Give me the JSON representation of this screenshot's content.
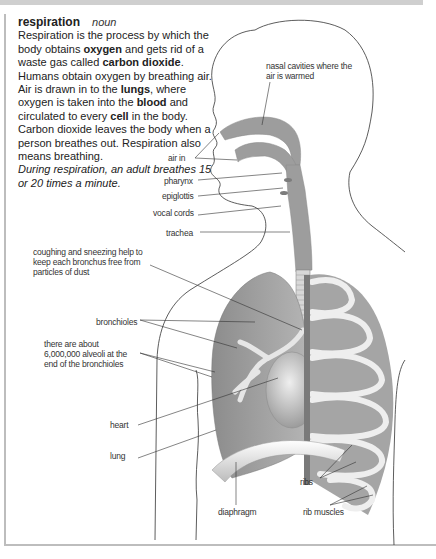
{
  "entry": {
    "headword": "respiration",
    "part_of_speech": "noun",
    "definition_parts": [
      {
        "text": "Respiration is the process by which the body obtains ",
        "bold": false
      },
      {
        "text": "oxygen",
        "bold": true
      },
      {
        "text": " and gets rid of a waste gas called ",
        "bold": false
      },
      {
        "text": "carbon dioxide",
        "bold": true
      },
      {
        "text": ". Humans obtain oxygen by breathing air. Air is drawn in to the ",
        "bold": false
      },
      {
        "text": "lungs",
        "bold": true
      },
      {
        "text": ", where oxygen is taken into the ",
        "bold": false
      },
      {
        "text": "blood",
        "bold": true
      },
      {
        "text": " and circulated to every ",
        "bold": false
      },
      {
        "text": "cell",
        "bold": true
      },
      {
        "text": " in the body. Carbon dioxide leaves the body when a person breathes out. Respiration also means breathing.",
        "bold": false
      }
    ],
    "example": "During respiration, an adult breathes 15 or 20 times a minute."
  },
  "labels": {
    "nasal_cavities": "nasal cavities where the air is warmed",
    "air_in": "air in",
    "pharynx": "pharynx",
    "epiglottis": "epiglottis",
    "vocal_cords": "vocal cords",
    "trachea": "trachea",
    "coughing": "coughing and sneezing help to keep each bronchus free from particles of dust",
    "bronchioles": "bronchioles",
    "alveoli": "there are about 6,000,000 alveoli at the end of the bronchioles",
    "heart": "heart",
    "lung": "lung",
    "ribs": "ribs",
    "diaphragm": "diaphragm",
    "rib_muscles": "rib muscles"
  },
  "colors": {
    "organ_gray": "#9a9a9a",
    "organ_light": "#d6d6d6",
    "outline": "#333333",
    "frame": "#bdbdbd"
  }
}
